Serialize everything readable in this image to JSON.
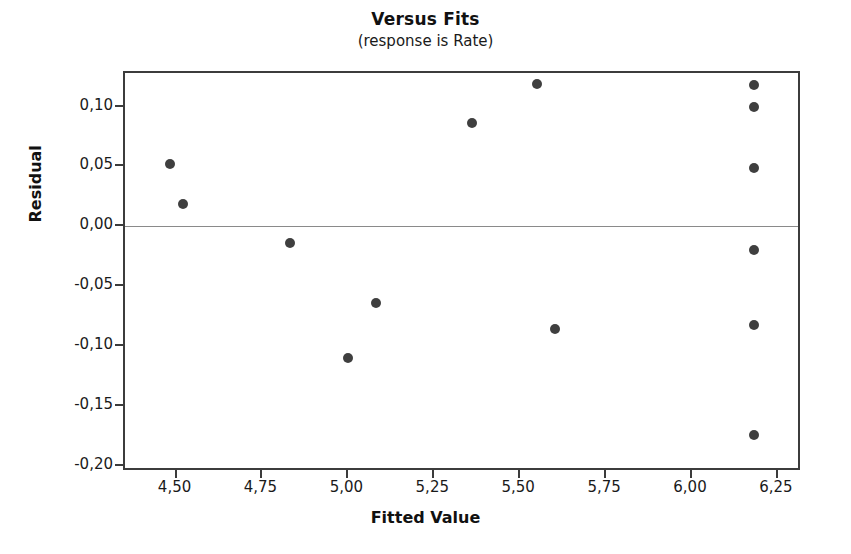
{
  "chart_data": {
    "type": "scatter",
    "title": "Versus Fits",
    "subtitle": "(response is Rate)",
    "xlabel": "Fitted Value",
    "ylabel": "Residual",
    "xlim": [
      4.35,
      6.32
    ],
    "ylim": [
      -0.205,
      0.128
    ],
    "grid": false,
    "legend": null,
    "reference_line": {
      "orientation": "horizontal",
      "value": 0.0,
      "color": "#8a8a8a"
    },
    "marker": {
      "shape": "circle",
      "color": "#3f3f3f",
      "size_px": 10
    },
    "xticks": [
      "4,50",
      "4,75",
      "5,00",
      "5,25",
      "5,50",
      "5,75",
      "6,00",
      "6,25"
    ],
    "xtick_values": [
      4.5,
      4.75,
      5.0,
      5.25,
      5.5,
      5.75,
      6.0,
      6.25
    ],
    "yticks": [
      "0,10",
      "0,05",
      "0,00",
      "-0,05",
      "-0,10",
      "-0,15",
      "-0,20"
    ],
    "ytick_values": [
      0.1,
      0.05,
      0.0,
      -0.05,
      -0.1,
      -0.15,
      -0.2
    ],
    "decimal_separator": ",",
    "points": [
      {
        "x": 4.48,
        "y": 0.052
      },
      {
        "x": 4.52,
        "y": 0.019
      },
      {
        "x": 4.83,
        "y": -0.014
      },
      {
        "x": 5.0,
        "y": -0.11
      },
      {
        "x": 5.08,
        "y": -0.064
      },
      {
        "x": 5.36,
        "y": 0.086
      },
      {
        "x": 5.55,
        "y": 0.119
      },
      {
        "x": 5.6,
        "y": -0.086
      },
      {
        "x": 6.18,
        "y": 0.118
      },
      {
        "x": 6.18,
        "y": 0.1
      },
      {
        "x": 6.18,
        "y": 0.049
      },
      {
        "x": 6.18,
        "y": -0.02
      },
      {
        "x": 6.18,
        "y": -0.082
      },
      {
        "x": 6.18,
        "y": -0.174
      }
    ]
  }
}
